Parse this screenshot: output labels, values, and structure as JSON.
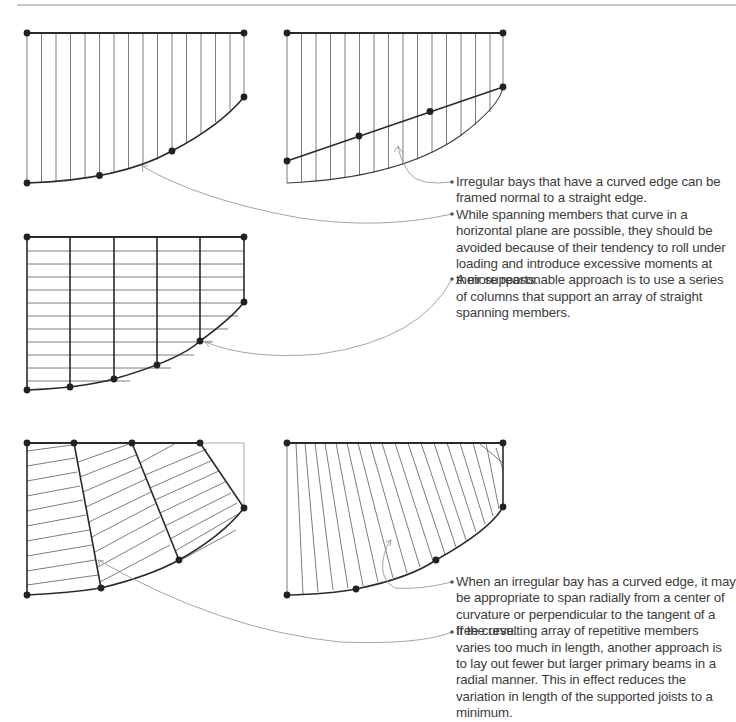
{
  "page": {
    "top_rule": true
  },
  "diagrams": [
    {
      "id": "curved-bay-normal-framing",
      "description": "Irregular bay with curved edge framed normal to straight edge, vertical joists"
    },
    {
      "id": "curved-bay-straight-girder",
      "description": "Bay with straight girder and joists extending to curved edge"
    },
    {
      "id": "curved-bay-columns-straight-members",
      "description": "Series of columns supporting array of straight spanning members"
    },
    {
      "id": "radial-primary-beams",
      "description": "Fewer larger primary beams laid out radially with joists between"
    },
    {
      "id": "radial-joists",
      "description": "Joists spanning radially from center of curvature"
    }
  ],
  "notes_top": {
    "items": [
      "Irregular bays that have a curved edge can be framed normal to a straight edge.",
      "While spanning members that curve in a horizontal plane are possible, they should be avoided because of their tendency to roll under loading and introduce excessive moments at their supports.",
      "A more reasonable approach is to use a series of columns that support an array of straight spanning members."
    ]
  },
  "notes_bottom": {
    "items": [
      "When an irregular bay has a curved edge, it may be appropriate to span radially from a center of curvature or perpendicular to the tangent of a free curve.",
      "If the resulting array of repetitive members varies too much in length, another approach is to lay out fewer but larger primary beams in a radial manner. This in effect reduces the variation in length of the supported joists to a minimum."
    ]
  },
  "colors": {
    "line_dark": "#2a2a2a",
    "line_thin": "#6d6d6d",
    "leader": "#9a9a9a",
    "text": "#3c3c3c"
  }
}
